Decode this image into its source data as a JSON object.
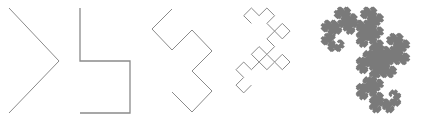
{
  "figure": {
    "stroke_color": "#8a8a8a",
    "fill_color": "#7a7a7a",
    "panels": [
      {
        "name": "iteration-1",
        "iterations": 1,
        "points": [
          [
            9,
            8
          ],
          [
            59,
            61
          ],
          [
            9,
            113
          ]
        ]
      },
      {
        "name": "iteration-2",
        "iterations": 2,
        "points": [
          [
            80,
            8
          ],
          [
            80,
            61
          ],
          [
            130,
            61
          ],
          [
            130,
            113
          ],
          [
            80,
            113
          ]
        ]
      },
      {
        "name": "iteration-3",
        "iterations": 3,
        "points": [
          [
            172,
            9
          ],
          [
            152,
            29
          ],
          [
            172,
            50
          ],
          [
            192,
            30
          ],
          [
            212,
            51
          ],
          [
            192,
            71
          ],
          [
            212,
            91
          ],
          [
            192,
            112
          ],
          [
            172,
            92
          ]
        ]
      },
      {
        "name": "iteration-5",
        "iterations": 5,
        "start": [
          258,
          19
        ],
        "step": 10,
        "angle": 225
      },
      {
        "name": "iteration-high",
        "iterations": 12,
        "start": [
          345,
          20
        ],
        "step": 1.9,
        "angle": 225
      }
    ]
  }
}
